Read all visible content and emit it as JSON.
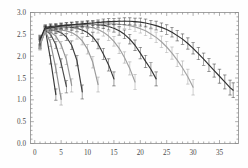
{
  "chart_data": {
    "type": "line",
    "title": "",
    "subtitle": "",
    "xlabel": "",
    "ylabel": "",
    "xlim": [
      -0.8,
      38.6
    ],
    "ylim": [
      0.0,
      3.0
    ],
    "xticks": [
      0,
      5,
      10,
      15,
      20,
      25,
      30,
      35
    ],
    "xtick_labels": [
      "0",
      "5",
      "10",
      "15",
      "20",
      "25",
      "30",
      "35"
    ],
    "yticks": [
      0.0,
      0.5,
      1.0,
      1.5,
      2.0,
      2.5,
      3.0
    ],
    "ytick_labels": [
      "0.0",
      "0.5",
      "1.0",
      "1.5",
      "2.0",
      "2.5",
      "3.0"
    ],
    "minor_ticks": true,
    "grid": false,
    "frame": true,
    "legend": null,
    "error_bars": true,
    "marker": "errorbar-cap",
    "series": [
      {
        "name": "curve-1",
        "color": "#3a3a3a",
        "x": [
          1,
          2,
          3,
          4
        ],
        "y": [
          2.28,
          2.62,
          1.92,
          1.12
        ],
        "yerr": [
          0.1,
          0.06,
          0.1,
          0.13
        ]
      },
      {
        "name": "curve-2",
        "color": "#8c8c8c",
        "x": [
          1,
          2,
          3,
          4,
          5
        ],
        "y": [
          2.24,
          2.58,
          2.3,
          1.72,
          1.01
        ],
        "yerr": [
          0.1,
          0.06,
          0.08,
          0.1,
          0.13
        ]
      },
      {
        "name": "curve-3",
        "color": "#4a4a4a",
        "x": [
          1,
          2,
          3,
          4,
          5,
          6
        ],
        "y": [
          2.3,
          2.6,
          2.5,
          2.26,
          1.84,
          1.3
        ],
        "yerr": [
          0.1,
          0.06,
          0.07,
          0.08,
          0.1,
          0.14
        ]
      },
      {
        "name": "curve-4",
        "color": "#949494",
        "x": [
          1,
          2,
          3,
          4,
          5,
          6,
          7
        ],
        "y": [
          2.26,
          2.57,
          2.55,
          2.46,
          2.26,
          1.92,
          1.33
        ],
        "yerr": [
          0.1,
          0.06,
          0.06,
          0.07,
          0.08,
          0.11,
          0.15
        ]
      },
      {
        "name": "curve-5",
        "color": "#3f3f3f",
        "x": [
          1,
          2,
          3,
          4,
          5,
          6,
          7,
          8,
          9
        ],
        "y": [
          2.32,
          2.62,
          2.6,
          2.58,
          2.54,
          2.44,
          2.25,
          1.9,
          1.18
        ],
        "yerr": [
          0.1,
          0.06,
          0.06,
          0.06,
          0.07,
          0.08,
          0.1,
          0.12,
          0.16
        ]
      },
      {
        "name": "curve-6",
        "color": "#9a9a9a",
        "x": [
          1,
          2,
          3,
          4,
          5,
          6,
          7,
          8,
          9,
          10,
          11,
          12
        ],
        "y": [
          2.27,
          2.58,
          2.59,
          2.6,
          2.6,
          2.58,
          2.54,
          2.47,
          2.35,
          2.16,
          1.86,
          1.35
        ],
        "yerr": [
          0.1,
          0.06,
          0.06,
          0.06,
          0.06,
          0.07,
          0.07,
          0.08,
          0.09,
          0.11,
          0.13,
          0.17
        ]
      },
      {
        "name": "curve-7",
        "color": "#363636",
        "x": [
          1,
          2,
          3,
          4,
          5,
          6,
          7,
          8,
          9,
          10,
          11,
          12,
          13,
          14,
          15
        ],
        "y": [
          2.34,
          2.63,
          2.64,
          2.66,
          2.67,
          2.67,
          2.66,
          2.64,
          2.6,
          2.54,
          2.44,
          2.28,
          2.05,
          1.8,
          1.48
        ],
        "yerr": [
          0.1,
          0.06,
          0.06,
          0.06,
          0.06,
          0.06,
          0.07,
          0.07,
          0.08,
          0.09,
          0.1,
          0.11,
          0.13,
          0.14,
          0.16
        ]
      },
      {
        "name": "curve-8",
        "color": "#9e9e9e",
        "x": [
          1,
          2,
          3,
          4,
          5,
          6,
          7,
          8,
          9,
          10,
          11,
          12,
          13,
          14,
          15,
          16,
          17,
          18,
          19
        ],
        "y": [
          2.28,
          2.59,
          2.61,
          2.63,
          2.65,
          2.66,
          2.67,
          2.68,
          2.68,
          2.67,
          2.65,
          2.61,
          2.55,
          2.46,
          2.34,
          2.18,
          1.97,
          1.72,
          1.41
        ],
        "yerr": [
          0.1,
          0.06,
          0.06,
          0.06,
          0.06,
          0.06,
          0.06,
          0.06,
          0.07,
          0.07,
          0.08,
          0.08,
          0.09,
          0.1,
          0.11,
          0.12,
          0.13,
          0.15,
          0.17
        ]
      },
      {
        "name": "curve-9",
        "color": "#333333",
        "x": [
          1,
          2,
          3,
          4,
          5,
          6,
          7,
          8,
          9,
          10,
          11,
          12,
          13,
          14,
          15,
          16,
          17,
          18,
          19,
          20,
          21,
          22,
          23
        ],
        "y": [
          2.36,
          2.64,
          2.66,
          2.67,
          2.69,
          2.7,
          2.71,
          2.72,
          2.72,
          2.73,
          2.73,
          2.72,
          2.71,
          2.68,
          2.64,
          2.58,
          2.5,
          2.39,
          2.25,
          2.07,
          1.88,
          1.7,
          1.48
        ],
        "yerr": [
          0.1,
          0.06,
          0.06,
          0.06,
          0.06,
          0.06,
          0.06,
          0.06,
          0.06,
          0.07,
          0.07,
          0.07,
          0.08,
          0.08,
          0.09,
          0.1,
          0.1,
          0.11,
          0.12,
          0.13,
          0.14,
          0.15,
          0.16
        ]
      },
      {
        "name": "curve-10",
        "color": "#a2a2a2",
        "x": [
          1,
          2,
          3,
          4,
          5,
          6,
          7,
          8,
          9,
          10,
          11,
          12,
          13,
          14,
          15,
          16,
          17,
          18,
          19,
          20,
          21,
          22,
          23,
          24,
          25,
          26,
          27,
          28,
          29,
          30
        ],
        "y": [
          2.29,
          2.6,
          2.62,
          2.64,
          2.66,
          2.67,
          2.69,
          2.7,
          2.71,
          2.72,
          2.73,
          2.73,
          2.74,
          2.74,
          2.74,
          2.73,
          2.72,
          2.7,
          2.67,
          2.63,
          2.58,
          2.51,
          2.43,
          2.33,
          2.21,
          2.07,
          1.91,
          1.73,
          1.53,
          1.29
        ],
        "yerr": [
          0.1,
          0.06,
          0.06,
          0.06,
          0.06,
          0.06,
          0.06,
          0.06,
          0.06,
          0.06,
          0.07,
          0.07,
          0.07,
          0.07,
          0.08,
          0.08,
          0.09,
          0.09,
          0.1,
          0.1,
          0.11,
          0.11,
          0.12,
          0.13,
          0.13,
          0.14,
          0.15,
          0.16,
          0.17,
          0.18
        ]
      },
      {
        "name": "curve-11",
        "color": "#2e2e2e",
        "x": [
          1,
          2,
          3,
          4,
          5,
          6,
          7,
          8,
          9,
          10,
          11,
          12,
          13,
          14,
          15,
          16,
          17,
          18,
          19,
          20,
          21,
          22,
          23,
          24,
          25,
          26,
          27,
          28,
          29,
          30,
          31,
          32,
          33,
          34,
          35,
          36,
          37,
          37.6
        ],
        "y": [
          2.38,
          2.66,
          2.68,
          2.69,
          2.7,
          2.71,
          2.72,
          2.73,
          2.74,
          2.75,
          2.76,
          2.77,
          2.78,
          2.79,
          2.79,
          2.8,
          2.8,
          2.8,
          2.79,
          2.78,
          2.76,
          2.73,
          2.7,
          2.66,
          2.61,
          2.55,
          2.47,
          2.39,
          2.29,
          2.18,
          2.06,
          1.93,
          1.8,
          1.67,
          1.54,
          1.41,
          1.28,
          1.22
        ],
        "yerr": [
          0.1,
          0.06,
          0.06,
          0.06,
          0.06,
          0.06,
          0.06,
          0.06,
          0.06,
          0.06,
          0.06,
          0.06,
          0.07,
          0.07,
          0.07,
          0.07,
          0.08,
          0.08,
          0.08,
          0.09,
          0.09,
          0.09,
          0.1,
          0.1,
          0.11,
          0.11,
          0.12,
          0.12,
          0.13,
          0.13,
          0.14,
          0.14,
          0.15,
          0.15,
          0.16,
          0.16,
          0.17,
          0.17
        ]
      }
    ]
  }
}
